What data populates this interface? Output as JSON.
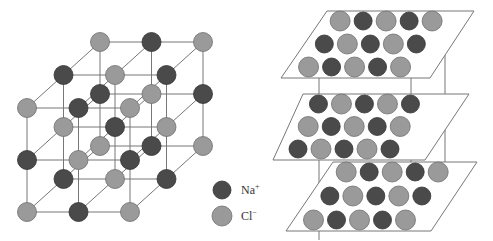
{
  "colors": {
    "na": "#4a4a4a",
    "cl": "#9a9a9a",
    "na_stroke": "#333333",
    "cl_stroke": "#6e6e6e",
    "line": "#777777"
  },
  "legend": [
    {
      "ion": "Na",
      "charge": "+",
      "color_key": "na"
    },
    {
      "ion": "Cl",
      "charge": "−",
      "color_key": "cl"
    }
  ],
  "cube": {
    "atoms": [
      {
        "x": 101,
        "y": 40,
        "t": "cl"
      },
      {
        "x": 146,
        "y": 40,
        "t": "na"
      },
      {
        "x": 199,
        "y": 41,
        "t": "cl"
      },
      {
        "x": 63,
        "y": 73,
        "t": "na"
      },
      {
        "x": 114,
        "y": 77,
        "t": "cl"
      },
      {
        "x": 166,
        "y": 78,
        "t": "na"
      },
      {
        "x": 201,
        "y": 89,
        "t": "na"
      },
      {
        "x": 100,
        "y": 92,
        "t": "na"
      },
      {
        "x": 146,
        "y": 96,
        "t": "na"
      },
      {
        "x": 29,
        "y": 107,
        "t": "cl"
      },
      {
        "x": 87,
        "y": 107,
        "t": "na"
      },
      {
        "x": 133,
        "y": 109,
        "t": "cl"
      },
      {
        "x": 65,
        "y": 124,
        "t": "cl"
      },
      {
        "x": 114,
        "y": 124,
        "t": "na"
      },
      {
        "x": 167,
        "y": 123,
        "t": "cl"
      },
      {
        "x": 100,
        "y": 144,
        "t": "cl"
      },
      {
        "x": 142,
        "y": 143,
        "t": "na"
      },
      {
        "x": 201,
        "y": 144,
        "t": "cl"
      },
      {
        "x": 32,
        "y": 160,
        "t": "na"
      },
      {
        "x": 85,
        "y": 160,
        "t": "cl"
      },
      {
        "x": 133,
        "y": 157,
        "t": "na"
      },
      {
        "x": 62,
        "y": 181,
        "t": "na"
      },
      {
        "x": 108,
        "y": 181,
        "t": "cl"
      },
      {
        "x": 167,
        "y": 181,
        "t": "na"
      },
      {
        "x": 27,
        "y": 212,
        "t": "cl"
      },
      {
        "x": 84,
        "y": 212,
        "t": "na"
      },
      {
        "x": 130,
        "y": 212,
        "t": "cl"
      }
    ]
  },
  "layers": [
    {
      "plane": [
        [
          327,
          11
        ],
        [
          474,
          11
        ],
        [
          430,
          78
        ],
        [
          281,
          78
        ]
      ],
      "rows": [
        [
          "cl",
          "na",
          "cl",
          "na",
          "cl"
        ],
        [
          "na",
          "cl",
          "na",
          "cl",
          "na"
        ],
        [
          "cl",
          "na",
          "cl",
          "na",
          "cl"
        ]
      ]
    },
    {
      "plane": [
        [
          303,
          94
        ],
        [
          469,
          94
        ],
        [
          425,
          160
        ],
        [
          273,
          160
        ]
      ],
      "rows": [
        [
          "na",
          "cl",
          "na",
          "cl",
          "na"
        ],
        [
          "cl",
          "na",
          "cl",
          "na",
          "cl"
        ],
        [
          "na",
          "cl",
          "na",
          "cl",
          "na"
        ]
      ]
    },
    {
      "plane": [
        [
          333,
          162
        ],
        [
          477,
          162
        ],
        [
          431,
          231
        ],
        [
          286,
          231
        ]
      ],
      "rows": [
        [
          "cl",
          "na",
          "cl",
          "na",
          "cl"
        ],
        [
          "na",
          "cl",
          "na",
          "cl",
          "na"
        ],
        [
          "cl",
          "na",
          "cl",
          "na",
          "cl"
        ]
      ]
    }
  ]
}
